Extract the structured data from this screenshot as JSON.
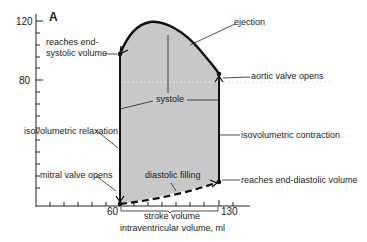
{
  "figure": {
    "panel_label": "A",
    "y_ticks": [
      "120",
      "80"
    ],
    "x_ticks": [
      "60",
      "130"
    ],
    "x_axis_label": "intraventricular volume, ml",
    "brace_label": "stroke volume"
  },
  "annotations": {
    "ejection": "ejection",
    "reaches_end_systolic_1": "reaches end-",
    "reaches_end_systolic_2": "systolic volume",
    "aortic_valve_opens": "aortic valve opens",
    "systole": "systole",
    "isovolumetric_relaxation": "isovolumetric relaxation",
    "isovolumetric_contraction": "isovolumetric contraction",
    "mitral_valve_opens": "mitral valve opens",
    "diastolic_filling": "diastolic filling",
    "reaches_end_diastolic": "reaches end-diastolic volume"
  },
  "colors": {
    "loop_fill": "#c8c8c8",
    "stroke": "#111111"
  }
}
